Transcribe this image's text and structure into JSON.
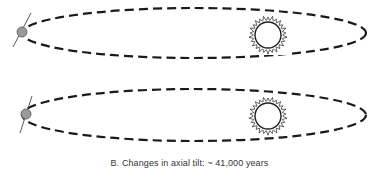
{
  "diagram": {
    "caption": "B. Changes in axial tilt:  ~  41,000 years",
    "panels": [
      {
        "id": "top",
        "orbit": {
          "cx": 194,
          "cy": 33,
          "rx": 172,
          "ry": 25
        },
        "planet": {
          "cx": 22,
          "cy": 32,
          "r": 5,
          "tilt_line": {
            "x1": 13,
            "y1": 47,
            "x2": 31,
            "y2": 13
          }
        },
        "sun": {
          "cx": 268,
          "cy": 35,
          "r": 13
        }
      },
      {
        "id": "bottom",
        "orbit": {
          "cx": 194,
          "cy": 115,
          "rx": 172,
          "ry": 26
        },
        "planet": {
          "cx": 26,
          "cy": 114,
          "r": 5,
          "tilt_line": {
            "x1": 20,
            "y1": 133,
            "x2": 32,
            "y2": 96
          }
        },
        "sun": {
          "cx": 268,
          "cy": 116,
          "r": 13
        }
      }
    ],
    "colors": {
      "orbit": "#1a1a1a",
      "planet_fill": "#9a9a9a",
      "planet_stroke": "#555555",
      "sun_stroke": "#222222",
      "tilt_line": "#444444"
    }
  }
}
